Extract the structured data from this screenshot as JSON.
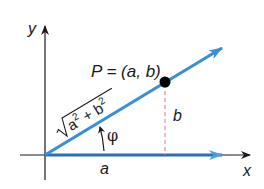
{
  "diagram": {
    "type": "vector-polar-form",
    "axes": {
      "x_label": "x",
      "y_label": "y"
    },
    "point": {
      "label": "P = (a, b)"
    },
    "horizontal_component": {
      "label": "a"
    },
    "vertical_component": {
      "label": "b"
    },
    "magnitude": {
      "label_radicand_a": "a",
      "label_radicand_b": "b",
      "exponent": "2",
      "plus": "+"
    },
    "angle": {
      "label": "φ"
    },
    "colors": {
      "vector": "#3a8fd6",
      "horizontal_vector": "#2a6fb8",
      "axes": "#1a1a1a",
      "dashed_component": "#d4788f",
      "point": "#000000"
    }
  }
}
